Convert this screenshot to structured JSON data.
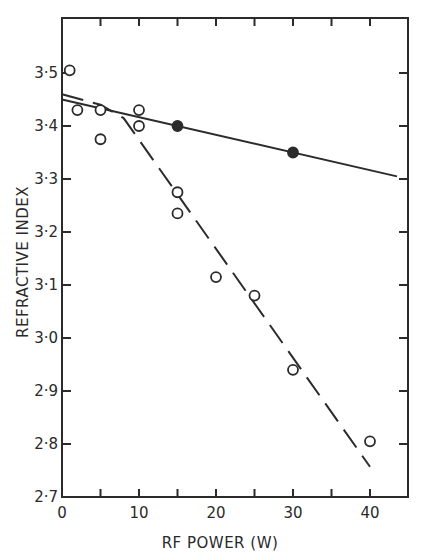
{
  "chart_data": {
    "type": "scatter",
    "title": "",
    "xlabel": "RF POWER (W)",
    "ylabel": "REFRACTIVE INDEX",
    "xlim": [
      0,
      45
    ],
    "ylim": [
      2.7,
      3.6
    ],
    "x_ticks": [
      0,
      10,
      20,
      30,
      40
    ],
    "x_tick_labels": [
      "0",
      "10",
      "20",
      "30",
      "40"
    ],
    "y_ticks": [
      2.7,
      2.8,
      2.9,
      3.0,
      3.1,
      3.2,
      3.3,
      3.4,
      3.5
    ],
    "y_tick_labels": [
      "2·7",
      "2·8",
      "2·9",
      "3·0",
      "3·1",
      "3·2",
      "3·3",
      "3·4",
      "3·5"
    ],
    "grid": false,
    "legend": null,
    "series": [
      {
        "name": "open circles",
        "marker": "open-circle",
        "points": [
          [
            1,
            3.505
          ],
          [
            2,
            3.43
          ],
          [
            5,
            3.43
          ],
          [
            5,
            3.375
          ],
          [
            10,
            3.43
          ],
          [
            10,
            3.4
          ],
          [
            15,
            3.275
          ],
          [
            15,
            3.235
          ],
          [
            20,
            3.115
          ],
          [
            25,
            3.08
          ],
          [
            30,
            2.94
          ],
          [
            40,
            2.805
          ]
        ]
      },
      {
        "name": "filled circles",
        "marker": "filled-circle",
        "points": [
          [
            15,
            3.4
          ],
          [
            30,
            3.35
          ]
        ]
      }
    ],
    "fit_lines": [
      {
        "name": "solid fit (filled circles)",
        "style": "solid",
        "points": [
          [
            0,
            3.45
          ],
          [
            43.5,
            3.305
          ]
        ]
      },
      {
        "name": "dashed fit (open circles)",
        "style": "dashed",
        "points": [
          [
            0,
            3.46
          ],
          [
            5,
            3.44
          ],
          [
            8,
            3.415
          ],
          [
            40,
            2.757
          ]
        ]
      }
    ]
  }
}
